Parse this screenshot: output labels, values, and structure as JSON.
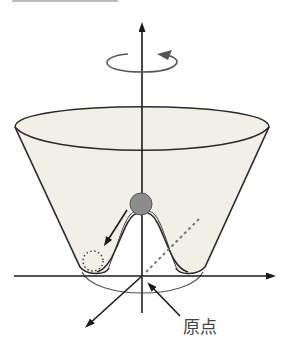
{
  "diagram": {
    "type": "mexican-hat-potential",
    "labels": {
      "origin": "原点"
    },
    "elements": [
      "vertical-axis-arrow",
      "rotation-arrow",
      "potential-surface",
      "ball-at-top",
      "ball-rolling-arrow",
      "dotted-ball-at-minimum",
      "horizontal-axis-arrow",
      "depth-axis-arrow",
      "dashed-radial-line",
      "origin-pointer-arrow"
    ],
    "colors": {
      "surface_fill": "#f2f0e6",
      "line": "#2a2a2a",
      "ball": "#8c8c8c",
      "label_text": "#444444"
    }
  }
}
